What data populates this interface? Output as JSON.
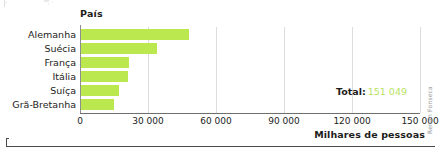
{
  "chart_data": {
    "type": "bar",
    "orientation": "horizontal",
    "title": "",
    "xlabel": "Milhares de pessoas",
    "ylabel": "País",
    "categories": [
      "Alemanha",
      "Suécia",
      "França",
      "Itália",
      "Suíça",
      "Grã-Bretanha"
    ],
    "values": [
      47600,
      33500,
      21200,
      20700,
      16700,
      14500
    ],
    "xlim": [
      0,
      150000
    ],
    "xticks": [
      0,
      30000,
      60000,
      90000,
      120000,
      150000
    ],
    "xticklabels": [
      "0",
      "30 000",
      "60 000",
      "90 000",
      "120 000",
      "150 000"
    ],
    "grid": "vertical",
    "legend": "none",
    "bar_color": "#bce84f",
    "annotations": [
      {
        "label": "Total:",
        "value": "151 049"
      }
    ]
  },
  "axes": {
    "y_title": "País",
    "x_title": "Milhares de pessoas"
  },
  "total": {
    "label": "Total:",
    "value": "151 049"
  },
  "credit": {
    "text": "Renan Fonseca"
  },
  "colors": {
    "bar": "#bce84f",
    "total_value": "#b9e262",
    "gridline": "#dcdcdc",
    "axis": "#6f6f6f",
    "text": "#1d1d1b"
  }
}
